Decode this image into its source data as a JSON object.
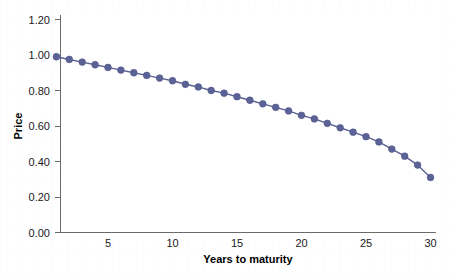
{
  "chart_data": {
    "type": "line",
    "title": "",
    "subtitle": "",
    "xlabel": "Years to maturity",
    "ylabel": "Price",
    "xlim": [
      0,
      31
    ],
    "ylim": [
      0.0,
      1.2
    ],
    "grid": false,
    "legend": null,
    "markers": true,
    "series_color": "#5b6296",
    "x_ticks": [
      5,
      10,
      15,
      20,
      25,
      30
    ],
    "x_tick_labels": [
      "5",
      "10",
      "15",
      "20",
      "25",
      "30"
    ],
    "y_ticks": [
      0.0,
      0.2,
      0.4,
      0.6,
      0.8,
      1.0,
      1.2
    ],
    "y_tick_labels": [
      "0.00",
      "0.20",
      "0.40",
      "0.60",
      "0.80",
      "1.00",
      "1.20"
    ],
    "x": [
      1,
      2,
      3,
      4,
      5,
      6,
      7,
      8,
      9,
      10,
      11,
      12,
      13,
      14,
      15,
      16,
      17,
      18,
      19,
      20,
      21,
      22,
      23,
      24,
      25,
      26,
      27,
      28,
      29,
      30
    ],
    "series": [
      {
        "name": "Price",
        "values": [
          0.99,
          0.975,
          0.96,
          0.945,
          0.93,
          0.915,
          0.9,
          0.885,
          0.87,
          0.855,
          0.835,
          0.82,
          0.8,
          0.785,
          0.765,
          0.745,
          0.725,
          0.705,
          0.685,
          0.66,
          0.64,
          0.615,
          0.59,
          0.565,
          0.54,
          0.51,
          0.47,
          0.43,
          0.38,
          0.31
        ]
      }
    ]
  },
  "axes": {
    "x_axis_name": "Years to maturity",
    "y_axis_name": "Price"
  }
}
